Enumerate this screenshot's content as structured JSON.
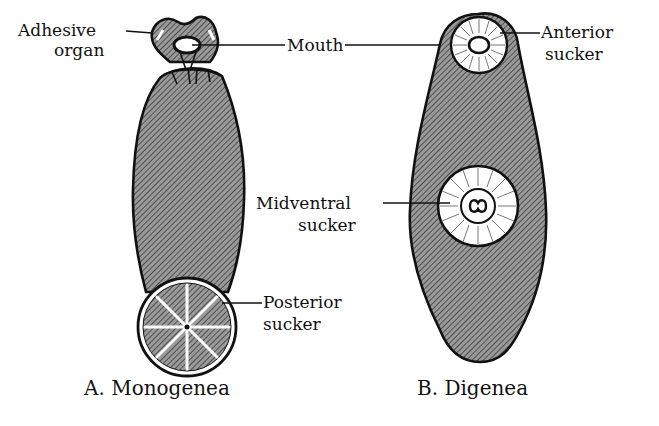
{
  "figure": {
    "panels": [
      {
        "id": "A",
        "caption": "A. Monogenea",
        "labels": {
          "adhesive_line1": "Adhesive",
          "adhesive_line2": "organ",
          "mouth": "Mouth",
          "posterior_line1": "Posterior",
          "posterior_line2": "sucker"
        }
      },
      {
        "id": "B",
        "caption": "B. Digenea",
        "labels": {
          "anterior_line1": "Anterior",
          "anterior_line2": "sucker",
          "midventral_line1": "Midventral",
          "midventral_line2": "sucker"
        }
      }
    ],
    "colors": {
      "ink": "#111111",
      "body_fill": "#8a8a8a",
      "background": "#ffffff"
    }
  }
}
